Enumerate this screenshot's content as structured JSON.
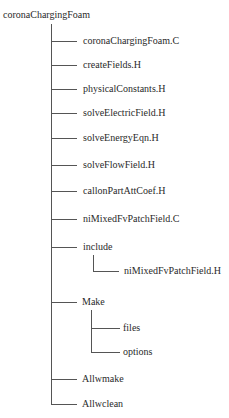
{
  "tree": {
    "root": "coronaChargingFoam",
    "children": [
      {
        "label": "coronaChargingFoam.C"
      },
      {
        "label": "createFields.H"
      },
      {
        "label": "physicalConstants.H"
      },
      {
        "label": "solveElectricField.H"
      },
      {
        "label": "solveEnergyEqn.H"
      },
      {
        "label": "solveFlowField.H"
      },
      {
        "label": "callonPartAttCoef.H"
      },
      {
        "label": "niMixedFvPatchField.C"
      },
      {
        "label": "include",
        "children": [
          {
            "label": "niMixedFvPatchField.H"
          }
        ]
      },
      {
        "label": "Make",
        "children": [
          {
            "label": "files"
          },
          {
            "label": "options"
          }
        ]
      },
      {
        "label": "Allwmake"
      },
      {
        "label": "Allwclean"
      }
    ]
  }
}
